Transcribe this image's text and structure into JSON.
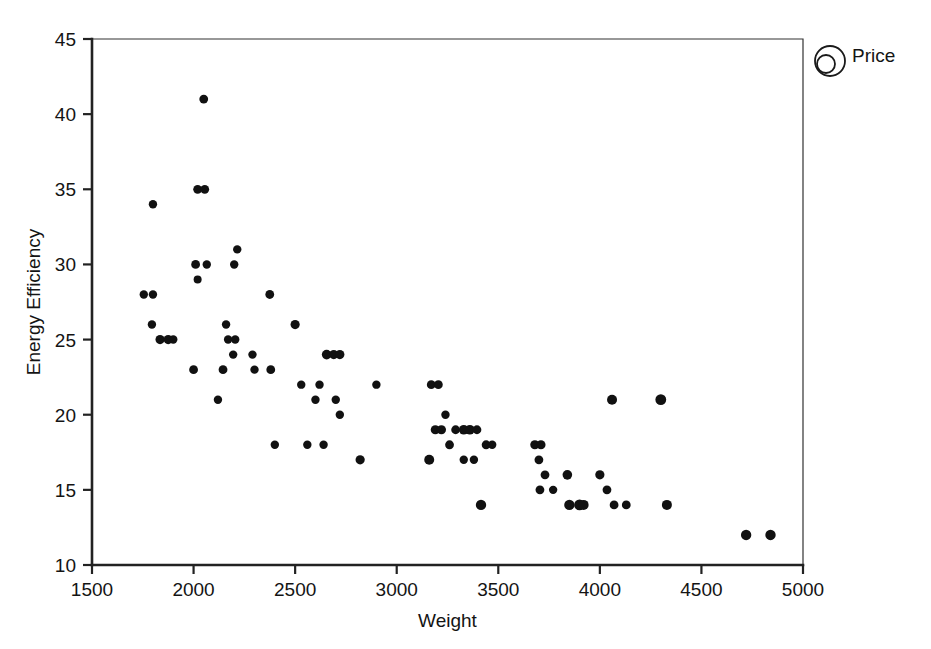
{
  "chart_data": {
    "type": "scatter",
    "title": "",
    "xlabel": "Weight",
    "ylabel": "Energy Efficiency",
    "xlim": [
      1500,
      5000
    ],
    "ylim": [
      10,
      45
    ],
    "xticks": [
      1500,
      2000,
      2500,
      3000,
      3500,
      4000,
      4500,
      5000
    ],
    "yticks": [
      10,
      15,
      20,
      25,
      30,
      35,
      40,
      45
    ],
    "xtick_labels": [
      "1500",
      "2000",
      "2500",
      "3000",
      "3500",
      "4000",
      "4500",
      "5000"
    ],
    "ytick_labels": [
      "10",
      "15",
      "20",
      "25",
      "30",
      "35",
      "40",
      "45"
    ],
    "grid": false,
    "legend_position": "top-right",
    "legend": [
      {
        "label": "Price",
        "symbol": "bubble-size-circles",
        "note": "marker area encodes Price"
      }
    ],
    "marker_color": "#111111",
    "size_encoding": "Price",
    "points": [
      {
        "x": 1755,
        "y": 28,
        "r": 4.2
      },
      {
        "x": 1800,
        "y": 28,
        "r": 4.2
      },
      {
        "x": 1800,
        "y": 34,
        "r": 4.2
      },
      {
        "x": 1795,
        "y": 26,
        "r": 4.2
      },
      {
        "x": 1835,
        "y": 25,
        "r": 4.6
      },
      {
        "x": 1875,
        "y": 25,
        "r": 4.6
      },
      {
        "x": 1900,
        "y": 25,
        "r": 4.2
      },
      {
        "x": 2010,
        "y": 30,
        "r": 4.4
      },
      {
        "x": 2020,
        "y": 35,
        "r": 4.4
      },
      {
        "x": 2055,
        "y": 35,
        "r": 4.4
      },
      {
        "x": 2050,
        "y": 41,
        "r": 4.4
      },
      {
        "x": 2020,
        "y": 29,
        "r": 4.0
      },
      {
        "x": 2000,
        "y": 23,
        "r": 4.4
      },
      {
        "x": 2065,
        "y": 30,
        "r": 4.2
      },
      {
        "x": 2120,
        "y": 21,
        "r": 4.2
      },
      {
        "x": 2145,
        "y": 23,
        "r": 4.4
      },
      {
        "x": 2160,
        "y": 26,
        "r": 4.2
      },
      {
        "x": 2170,
        "y": 25,
        "r": 4.2
      },
      {
        "x": 2205,
        "y": 25,
        "r": 4.2
      },
      {
        "x": 2215,
        "y": 31,
        "r": 4.2
      },
      {
        "x": 2200,
        "y": 30,
        "r": 4.2
      },
      {
        "x": 2195,
        "y": 24,
        "r": 4.2
      },
      {
        "x": 2290,
        "y": 24,
        "r": 4.2
      },
      {
        "x": 2300,
        "y": 23,
        "r": 4.2
      },
      {
        "x": 2380,
        "y": 23,
        "r": 4.4
      },
      {
        "x": 2375,
        "y": 28,
        "r": 4.4
      },
      {
        "x": 2400,
        "y": 18,
        "r": 4.2
      },
      {
        "x": 2500,
        "y": 26,
        "r": 4.6
      },
      {
        "x": 2530,
        "y": 22,
        "r": 4.2
      },
      {
        "x": 2560,
        "y": 18,
        "r": 4.2
      },
      {
        "x": 2600,
        "y": 21,
        "r": 4.2
      },
      {
        "x": 2620,
        "y": 22,
        "r": 4.2
      },
      {
        "x": 2640,
        "y": 18,
        "r": 4.2
      },
      {
        "x": 2655,
        "y": 24,
        "r": 4.8
      },
      {
        "x": 2690,
        "y": 24,
        "r": 4.6
      },
      {
        "x": 2720,
        "y": 24,
        "r": 4.6
      },
      {
        "x": 2700,
        "y": 21,
        "r": 4.2
      },
      {
        "x": 2720,
        "y": 20,
        "r": 4.2
      },
      {
        "x": 2820,
        "y": 17,
        "r": 4.6
      },
      {
        "x": 2900,
        "y": 22,
        "r": 4.2
      },
      {
        "x": 3160,
        "y": 17,
        "r": 5.0
      },
      {
        "x": 3170,
        "y": 22,
        "r": 4.4
      },
      {
        "x": 3205,
        "y": 22,
        "r": 4.4
      },
      {
        "x": 3190,
        "y": 19,
        "r": 4.6
      },
      {
        "x": 3220,
        "y": 19,
        "r": 4.6
      },
      {
        "x": 3240,
        "y": 20,
        "r": 4.2
      },
      {
        "x": 3260,
        "y": 18,
        "r": 4.4
      },
      {
        "x": 3290,
        "y": 19,
        "r": 4.4
      },
      {
        "x": 3330,
        "y": 19,
        "r": 4.8
      },
      {
        "x": 3360,
        "y": 19,
        "r": 4.8
      },
      {
        "x": 3395,
        "y": 19,
        "r": 4.4
      },
      {
        "x": 3330,
        "y": 17,
        "r": 4.2
      },
      {
        "x": 3380,
        "y": 17,
        "r": 4.2
      },
      {
        "x": 3415,
        "y": 14,
        "r": 5.2
      },
      {
        "x": 3440,
        "y": 18,
        "r": 4.4
      },
      {
        "x": 3470,
        "y": 18,
        "r": 4.2
      },
      {
        "x": 3680,
        "y": 18,
        "r": 4.6
      },
      {
        "x": 3710,
        "y": 18,
        "r": 4.6
      },
      {
        "x": 3700,
        "y": 17,
        "r": 4.4
      },
      {
        "x": 3705,
        "y": 15,
        "r": 4.4
      },
      {
        "x": 3730,
        "y": 16,
        "r": 4.4
      },
      {
        "x": 3770,
        "y": 15,
        "r": 4.2
      },
      {
        "x": 3840,
        "y": 16,
        "r": 4.8
      },
      {
        "x": 3850,
        "y": 14,
        "r": 5.2
      },
      {
        "x": 3900,
        "y": 14,
        "r": 5.4
      },
      {
        "x": 3920,
        "y": 14,
        "r": 5.0
      },
      {
        "x": 4000,
        "y": 16,
        "r": 4.6
      },
      {
        "x": 4035,
        "y": 15,
        "r": 4.4
      },
      {
        "x": 4060,
        "y": 21,
        "r": 5.0
      },
      {
        "x": 4070,
        "y": 14,
        "r": 4.4
      },
      {
        "x": 4130,
        "y": 14,
        "r": 4.4
      },
      {
        "x": 4300,
        "y": 21,
        "r": 5.4
      },
      {
        "x": 4330,
        "y": 14,
        "r": 5.0
      },
      {
        "x": 4720,
        "y": 12,
        "r": 5.2
      },
      {
        "x": 4840,
        "y": 12,
        "r": 5.2
      }
    ]
  },
  "plot_frame": {
    "left": 92,
    "right": 803,
    "top": 39,
    "bottom": 565
  },
  "legend_symbol": {
    "outer_cx": 830,
    "outer_cy": 61,
    "outer_r": 15,
    "inner_cx": 826,
    "inner_cy": 64,
    "inner_r": 9
  }
}
